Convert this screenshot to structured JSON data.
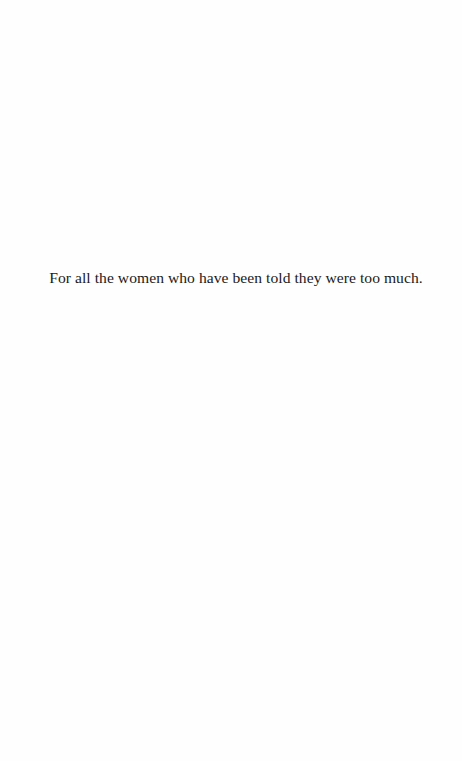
{
  "page": {
    "dedication": "For all the women who have been told they were too much."
  }
}
